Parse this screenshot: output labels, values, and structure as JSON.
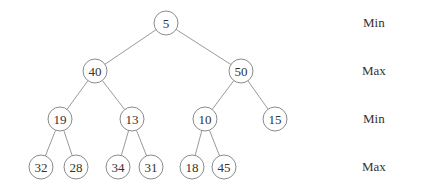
{
  "diagram": {
    "type": "min-max heap",
    "nodes": [
      {
        "id": "n5",
        "value": "5",
        "x": 166,
        "y": 23
      },
      {
        "id": "n40",
        "value": "40",
        "x": 95,
        "y": 71
      },
      {
        "id": "n50",
        "value": "50",
        "x": 241,
        "y": 71
      },
      {
        "id": "n19",
        "value": "19",
        "x": 60,
        "y": 119
      },
      {
        "id": "n13",
        "value": "13",
        "x": 132,
        "y": 119
      },
      {
        "id": "n10",
        "value": "10",
        "x": 205,
        "y": 119
      },
      {
        "id": "n15",
        "value": "15",
        "x": 275,
        "y": 119
      },
      {
        "id": "n32",
        "value": "32",
        "x": 41,
        "y": 167
      },
      {
        "id": "n28",
        "value": "28",
        "x": 76,
        "y": 167
      },
      {
        "id": "n34",
        "value": "34",
        "x": 118,
        "y": 167
      },
      {
        "id": "n31",
        "value": "31",
        "x": 151,
        "y": 167
      },
      {
        "id": "n18",
        "value": "18",
        "x": 192,
        "y": 167
      },
      {
        "id": "n45",
        "value": "45",
        "x": 224,
        "y": 167
      }
    ],
    "edges": [
      [
        "n5",
        "n40"
      ],
      [
        "n5",
        "n50"
      ],
      [
        "n40",
        "n19"
      ],
      [
        "n40",
        "n13"
      ],
      [
        "n50",
        "n10"
      ],
      [
        "n50",
        "n15"
      ],
      [
        "n19",
        "n32"
      ],
      [
        "n19",
        "n28"
      ],
      [
        "n13",
        "n34"
      ],
      [
        "n13",
        "n31"
      ],
      [
        "n10",
        "n18"
      ],
      [
        "n10",
        "n45"
      ]
    ],
    "level_labels": [
      {
        "text": "Min",
        "y": 23
      },
      {
        "text": "Max",
        "y": 71
      },
      {
        "text": "Min",
        "y": 119
      },
      {
        "text": "Max",
        "y": 167
      }
    ]
  }
}
